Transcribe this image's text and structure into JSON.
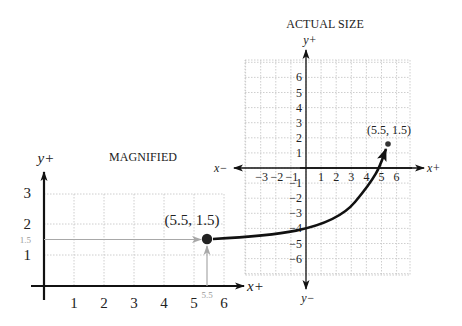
{
  "colors": {
    "axis": "#111111",
    "grid": "#c8c8c8",
    "guide": "#a8a8a8",
    "point": "#222222",
    "guide_label": "#9a9a9a"
  },
  "magnified": {
    "title": "MAGNIFIED",
    "y_axis_label": "y+",
    "x_axis_label": "x+",
    "x_ticks": [
      "1",
      "2",
      "3",
      "4",
      "5",
      "6"
    ],
    "y_ticks": [
      "1",
      "2",
      "3"
    ],
    "point_label": "(5.5, 1.5)",
    "guide_x_label": "5.5",
    "guide_y_label": "1.5",
    "point": {
      "x": 5.5,
      "y": 1.5
    }
  },
  "actual": {
    "title": "ACTUAL SIZE",
    "y_pos_label": "y+",
    "y_neg_label": "y−",
    "x_pos_label": "x+",
    "x_neg_label": "x−",
    "x_ticks_pos": [
      "1",
      "2",
      "3",
      "4",
      "5",
      "6"
    ],
    "x_ticks_neg": [
      "−3",
      "−2",
      "−1"
    ],
    "y_ticks_pos": [
      "1",
      "2",
      "3",
      "4",
      "5",
      "6"
    ],
    "y_ticks_neg": [
      "−1",
      "−2",
      "−3",
      "−4",
      "−5",
      "−6"
    ],
    "point_label": "(5.5, 1.5)",
    "point": {
      "x": 5.5,
      "y": 1.5
    }
  },
  "connector": {
    "description": "Curved arrow linking magnified point to actual-size point"
  },
  "chart_data": [
    {
      "type": "scatter",
      "title": "MAGNIFIED",
      "xlabel": "x+",
      "ylabel": "y+",
      "x_ticks": [
        1,
        2,
        3,
        4,
        5,
        6
      ],
      "y_ticks": [
        1,
        2,
        3
      ],
      "xlim": [
        0,
        6.7
      ],
      "ylim": [
        0,
        3.3
      ],
      "grid": true,
      "points": [
        {
          "x": 5.5,
          "y": 1.5,
          "label": "(5.5, 1.5)"
        }
      ],
      "annotations": [
        "guide line to x = 5.5",
        "guide line to y = 1.5"
      ]
    },
    {
      "type": "scatter",
      "title": "ACTUAL SIZE",
      "xlabel": "x+ / x−",
      "ylabel": "y+ / y−",
      "x_ticks": [
        -3,
        -2,
        -1,
        1,
        2,
        3,
        4,
        5,
        6
      ],
      "y_ticks": [
        -6,
        -5,
        -4,
        -3,
        -2,
        -1,
        1,
        2,
        3,
        4,
        5,
        6
      ],
      "xlim": [
        -4,
        7
      ],
      "ylim": [
        -7,
        7
      ],
      "grid": true,
      "points": [
        {
          "x": 5.5,
          "y": 1.5,
          "label": "(5.5, 1.5)"
        }
      ]
    }
  ]
}
